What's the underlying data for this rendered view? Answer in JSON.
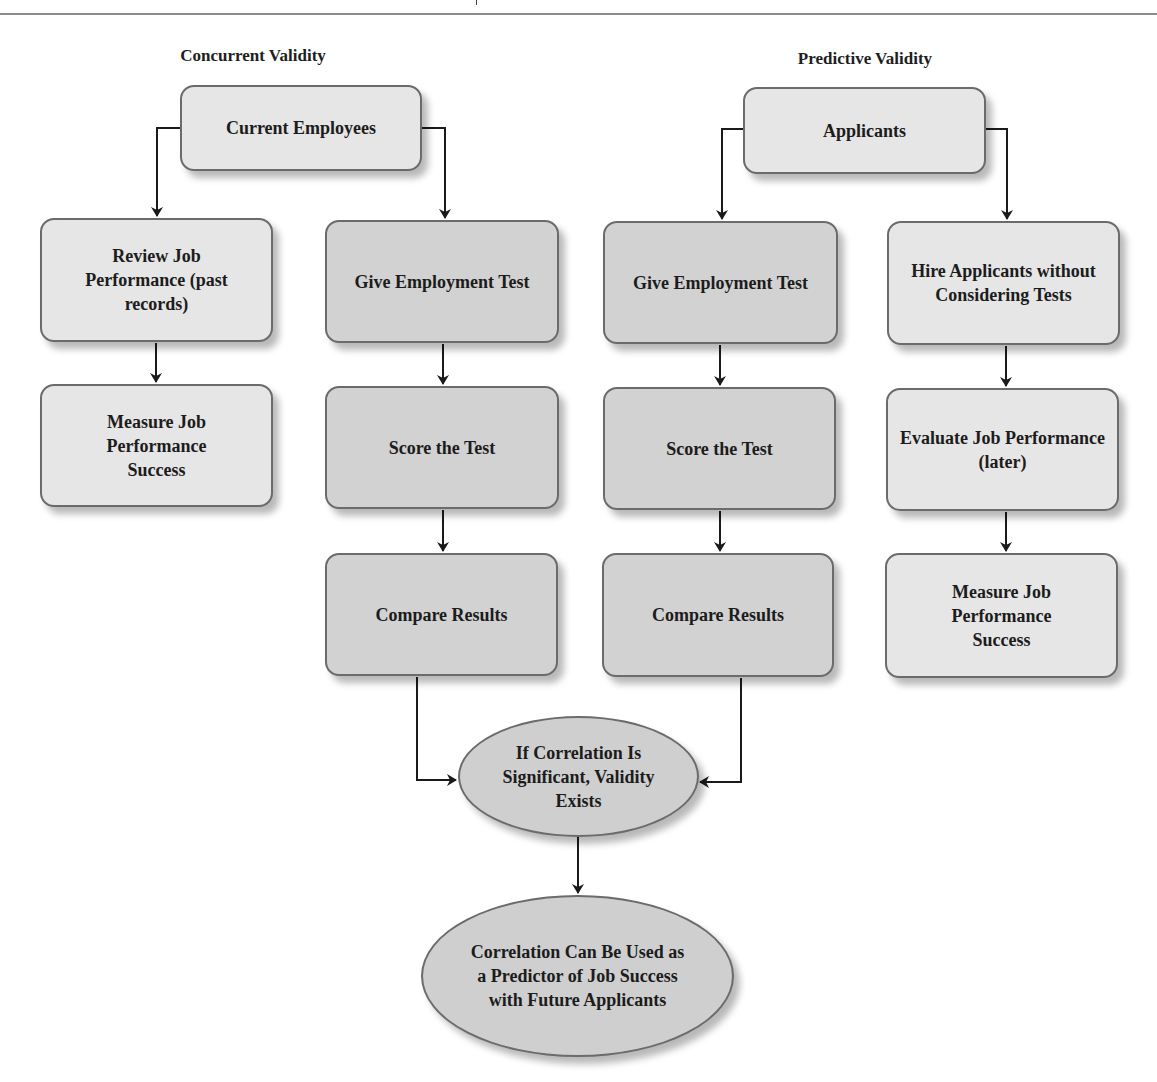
{
  "header": {
    "rule": "top-horizontal-rule"
  },
  "sections": {
    "concurrent": {
      "title": "Concurrent Validity"
    },
    "predictive": {
      "title": "Predictive Validity"
    }
  },
  "nodes": {
    "current_employees": "Current Employees",
    "applicants": "Applicants",
    "review_job_performance": "Review Job Performance (past records)",
    "measure_success_concurrent": "Measure Job Performance Success",
    "give_test_concurrent": "Give Employment Test",
    "score_test_concurrent": "Score the Test",
    "compare_concurrent": "Compare Results",
    "give_test_predictive": "Give Employment Test",
    "score_test_predictive": "Score the Test",
    "compare_predictive": "Compare Results",
    "hire_applicants": "Hire Applicants without Considering Tests",
    "evaluate_job_performance": "Evaluate Job Performance (later)",
    "measure_success_predictive": "Measure Job Performance Success",
    "correlation_significant": "If Correlation Is Significant, Validity Exists",
    "correlation_predictor": "Correlation Can Be Used as a Predictor of Job Success with Future Applicants"
  },
  "colors": {
    "light_box": "#e6e6e6",
    "dark_box": "#d2d2d2",
    "ellipse": "#cfcfcf",
    "border": "#6b6b6b",
    "arrow": "#1a1a1a"
  }
}
